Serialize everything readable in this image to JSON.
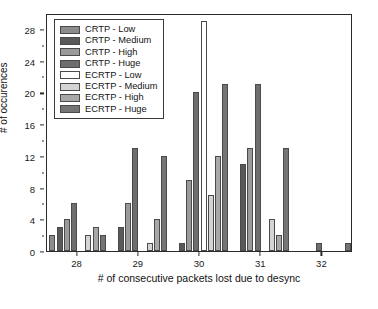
{
  "chart_data": {
    "type": "bar",
    "title": "",
    "xlabel": "# of consecutive packets lost due to desync",
    "ylabel": "# of occurences",
    "categories": [
      "28",
      "29",
      "30",
      "31",
      "32"
    ],
    "xtick_labels": [
      "28",
      "29",
      "30",
      "31",
      "32"
    ],
    "ytick_labels": [
      "0",
      "4",
      "8",
      "12",
      "16",
      "20",
      "24",
      "28"
    ],
    "ytick_values": [
      0,
      4,
      8,
      12,
      16,
      20,
      24,
      28
    ],
    "ylim": [
      0,
      30
    ],
    "grid": false,
    "legend_position": "upper left",
    "series": [
      {
        "name": "CRTP - Low",
        "color": "#8c8c8c",
        "values": [
          2,
          0,
          0,
          0,
          0
        ]
      },
      {
        "name": "CRTP - Medium",
        "color": "#595959",
        "values": [
          3,
          3,
          1,
          11,
          0
        ]
      },
      {
        "name": "CRTP - High",
        "color": "#9a9a9a",
        "values": [
          4,
          6,
          9,
          13,
          0
        ]
      },
      {
        "name": "CRTP - Huge",
        "color": "#6e6e6e",
        "values": [
          6,
          13,
          20,
          21,
          1
        ]
      },
      {
        "name": "ECRTP - Low",
        "color": "#ffffff",
        "values": [
          0,
          0,
          29,
          0,
          0
        ]
      },
      {
        "name": "ECRTP - Medium",
        "color": "#d4d4d4",
        "values": [
          2,
          1,
          7,
          4,
          0
        ]
      },
      {
        "name": "ECRTP - High",
        "color": "#a8a8a8",
        "values": [
          3,
          4,
          12,
          2,
          0
        ]
      },
      {
        "name": "ECRTP - Huge",
        "color": "#757575",
        "values": [
          2,
          12,
          21,
          13,
          1
        ]
      }
    ]
  },
  "legend": {
    "items": [
      {
        "label": "CRTP - Low"
      },
      {
        "label": "CRTP - Medium"
      },
      {
        "label": "CRTP - High"
      },
      {
        "label": "CRTP - Huge"
      },
      {
        "label": "ECRTP - Low"
      },
      {
        "label": "ECRTP - Medium"
      },
      {
        "label": "ECRTP - High"
      },
      {
        "label": "ECRTP - Huge"
      }
    ]
  },
  "caption": ""
}
